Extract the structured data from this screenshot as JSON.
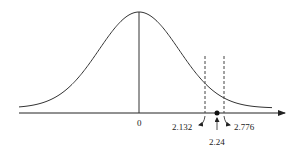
{
  "chart_data": {
    "type": "line",
    "title": "",
    "xlabel": "",
    "ylabel": "",
    "grid": false,
    "legend": null,
    "center_label": "0",
    "critical_lines": [
      {
        "value": 2.132,
        "label": "2.132",
        "style": "dashed"
      },
      {
        "value": 2.776,
        "label": "2.776",
        "style": "dashed"
      }
    ],
    "test_statistic": {
      "value": 2.24,
      "label": "2.24",
      "marker": "dot"
    },
    "colors": {
      "curve": "#333333",
      "axis": "#222222",
      "background": "#ffffff"
    }
  }
}
